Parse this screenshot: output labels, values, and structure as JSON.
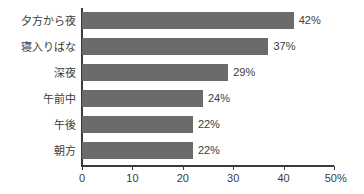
{
  "chart_data": {
    "type": "bar",
    "orientation": "horizontal",
    "title": "",
    "subtitle": "",
    "xlabel": "",
    "ylabel": "",
    "categories": [
      "夕方から夜",
      "寝入りばな",
      "深夜",
      "午前中",
      "午後",
      "朝方"
    ],
    "values": [
      42,
      37,
      29,
      24,
      22,
      22
    ],
    "value_labels": [
      "42%",
      "37%",
      "29%",
      "24%",
      "22%",
      "22%"
    ],
    "xlim": [
      0,
      50
    ],
    "xticks": [
      0,
      10,
      20,
      30,
      40,
      50
    ],
    "xtick_labels": [
      "0",
      "10",
      "20",
      "30",
      "40",
      "50%"
    ],
    "grid": false,
    "legend": null,
    "bar_color": "#6b6b6b",
    "axis_color": "#3a3a3a",
    "text_color": "#3c3c3c",
    "background": "#ffffff"
  }
}
